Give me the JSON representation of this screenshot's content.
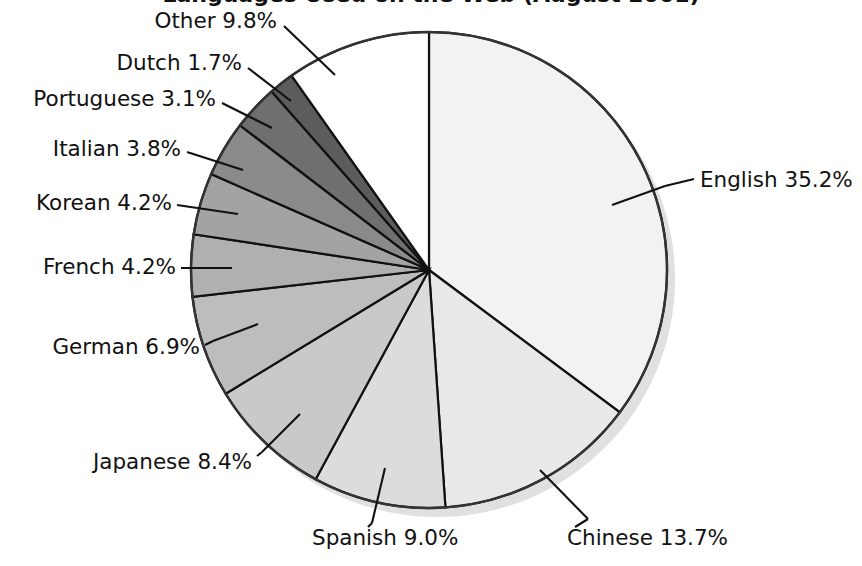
{
  "chart_data": {
    "type": "pie",
    "title": "Languages Used on the Web (August 2001)",
    "title_visibility": "cropped-at-top-edge",
    "subtitle": "",
    "xlabel": "",
    "ylabel": "",
    "grid": false,
    "legend_position": "none",
    "label_format": "name percent",
    "start_angle_deg": 0,
    "direction": "clockwise",
    "units": "percent",
    "total": 100.0,
    "categories": [
      "English",
      "Chinese",
      "Spanish",
      "Japanese",
      "German",
      "French",
      "Korean",
      "Italian",
      "Portuguese",
      "Dutch",
      "Other"
    ],
    "values": [
      35.2,
      13.7,
      9.0,
      8.4,
      6.9,
      4.2,
      4.2,
      3.8,
      3.1,
      1.7,
      9.8
    ],
    "slices": [
      {
        "name": "English",
        "value": 35.2,
        "label": "English 35.2%",
        "color": "#f2f2f2",
        "label_anchor": "start",
        "label_x": 700,
        "label_y": 181,
        "leader": [
          [
            665,
            186
          ],
          [
            694,
            179
          ]
        ],
        "tick": [
          [
            612,
            205
          ],
          [
            665,
            186
          ]
        ]
      },
      {
        "name": "Chinese",
        "value": 13.7,
        "label": "Chinese 13.7%",
        "color": "#e8e8e8",
        "label_anchor": "start",
        "label_x": 567,
        "label_y": 539,
        "leader": [
          [
            588,
            519
          ],
          [
            575,
            527
          ]
        ],
        "tick": [
          [
            540,
            470
          ],
          [
            588,
            519
          ]
        ]
      },
      {
        "name": "Spanish",
        "value": 9.0,
        "label": "Spanish 9.0%",
        "color": "#dcdcdc",
        "label_anchor": "start",
        "label_x": 312,
        "label_y": 539,
        "leader": [
          [
            372,
            523
          ],
          [
            368,
            527
          ]
        ],
        "tick": [
          [
            385,
            468
          ],
          [
            372,
            523
          ]
        ]
      },
      {
        "name": "Japanese",
        "value": 8.4,
        "label": "Japanese 8.4%",
        "color": "#c9c9c9",
        "label_anchor": "end",
        "label_x": 252,
        "label_y": 463,
        "leader": [
          [
            262,
            452
          ],
          [
            257,
            456
          ]
        ],
        "tick": [
          [
            300,
            414
          ],
          [
            262,
            452
          ]
        ]
      },
      {
        "name": "German",
        "value": 6.9,
        "label": "German 6.9%",
        "color": "#bdbdbd",
        "label_anchor": "end",
        "label_x": 200,
        "label_y": 348,
        "leader": [
          [
            213,
            341
          ],
          [
            205,
            345
          ]
        ],
        "tick": [
          [
            258,
            324
          ],
          [
            213,
            341
          ]
        ]
      },
      {
        "name": "French",
        "value": 4.2,
        "label": "French 4.2%",
        "color": "#b0b0b0",
        "label_anchor": "end",
        "label_x": 176,
        "label_y": 268,
        "leader": [
          [
            232,
            268
          ],
          [
            181,
            268
          ]
        ],
        "tick": [
          [
            232,
            268
          ],
          [
            232,
            268
          ]
        ]
      },
      {
        "name": "Korean",
        "value": 4.2,
        "label": "Korean 4.2%",
        "color": "#a3a3a3",
        "label_anchor": "end",
        "label_x": 172,
        "label_y": 204,
        "leader": [
          [
            238,
            214
          ],
          [
            177,
            205
          ]
        ],
        "tick": [
          [
            238,
            214
          ],
          [
            238,
            214
          ]
        ]
      },
      {
        "name": "Italian",
        "value": 3.8,
        "label": "Italian 3.8%",
        "color": "#8a8a8a",
        "label_anchor": "end",
        "label_x": 181,
        "label_y": 150,
        "leader": [
          [
            243,
            170
          ],
          [
            187,
            152
          ]
        ],
        "tick": [
          [
            243,
            170
          ],
          [
            243,
            170
          ]
        ]
      },
      {
        "name": "Portuguese",
        "value": 3.1,
        "label": "Portuguese 3.1%",
        "color": "#6f6f6f",
        "label_anchor": "end",
        "label_x": 216,
        "label_y": 100,
        "leader": [
          [
            272,
            128
          ],
          [
            222,
            103
          ]
        ],
        "tick": [
          [
            272,
            128
          ],
          [
            272,
            128
          ]
        ]
      },
      {
        "name": "Dutch",
        "value": 1.7,
        "label": "Dutch 1.7%",
        "color": "#5c5c5c",
        "label_anchor": "end",
        "label_x": 242,
        "label_y": 64,
        "leader": [
          [
            291,
            101
          ],
          [
            248,
            68
          ]
        ],
        "tick": [
          [
            291,
            101
          ],
          [
            291,
            101
          ]
        ]
      },
      {
        "name": "Other",
        "value": 9.8,
        "label": "Other 9.8%",
        "color": "#ffffff",
        "label_anchor": "end",
        "label_x": 277,
        "label_y": 22,
        "leader": [
          [
            335,
            75
          ],
          [
            284,
            26
          ]
        ],
        "tick": [
          [
            335,
            75
          ],
          [
            335,
            75
          ]
        ]
      }
    ],
    "geometry": {
      "center_x": 429,
      "center_y": 270,
      "radius": 238,
      "shadow_offset_x": 8,
      "shadow_offset_y": 9,
      "shadow_color": "#e0e0e0"
    },
    "colors": {
      "outline": "#333333",
      "slice_border": "#111111",
      "text": "#111111",
      "background": "#ffffff"
    }
  }
}
